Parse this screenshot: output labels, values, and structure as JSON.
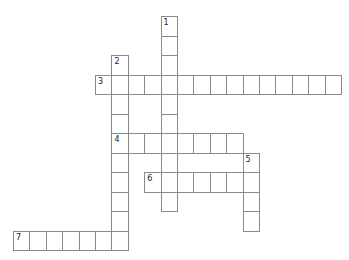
{
  "puzzle": {
    "grid": {
      "origin_x": 13,
      "origin_y": 16,
      "cell_w": 16.4,
      "cell_h": 19.5,
      "border_color": "#8a8a8a"
    },
    "entries": [
      {
        "number": "1",
        "direction": "down",
        "row": 0,
        "col": 9,
        "length": 10,
        "answer": ""
      },
      {
        "number": "2",
        "direction": "down",
        "row": 2,
        "col": 6,
        "length": 10,
        "answer": ""
      },
      {
        "number": "3",
        "direction": "across",
        "row": 3,
        "col": 5,
        "length": 15,
        "answer": ""
      },
      {
        "number": "4",
        "direction": "across",
        "row": 6,
        "col": 6,
        "length": 8,
        "answer": ""
      },
      {
        "number": "5",
        "direction": "down",
        "row": 7,
        "col": 14,
        "length": 4,
        "answer": ""
      },
      {
        "number": "6",
        "direction": "across",
        "row": 8,
        "col": 8,
        "length": 7,
        "answer": ""
      },
      {
        "number": "7",
        "direction": "across",
        "row": 11,
        "col": 0,
        "length": 7,
        "answer": ""
      }
    ]
  }
}
